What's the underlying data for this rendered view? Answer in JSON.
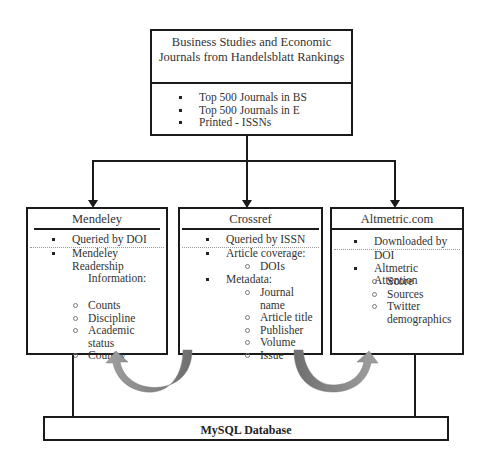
{
  "top_box": {
    "title_line1": "Business Studies and Economic",
    "title_line2": "Journals from Handelsblatt Rankings",
    "items": [
      "Top 500 Journals in BS",
      "Top 500 Journals in E",
      "Printed - ISSNs"
    ]
  },
  "mendeley": {
    "title": "Mendeley",
    "items": [
      {
        "text": "Queried by DOI"
      },
      {
        "text": "Mendeley"
      },
      {
        "text": "Readership"
      },
      {
        "text": "Information:"
      }
    ],
    "subitems": [
      "Counts",
      "Discipline",
      "Academic",
      "status",
      "Country"
    ]
  },
  "crossref": {
    "title": "Crossref",
    "items": [
      "Queried by ISSN",
      "Article coverage:",
      "Metadata:"
    ],
    "coverage_subitems": [
      "DOIs"
    ],
    "metadata_subitems": [
      "Journal name",
      "Article title",
      "Publisher",
      "Volume",
      "Issue"
    ]
  },
  "altmetric": {
    "title": "Altmetric.com",
    "items": [
      "Downloaded by",
      "DOI",
      "Altmetric Attention"
    ],
    "subitems": [
      "Score",
      "Sources",
      "Twitter",
      "demographics"
    ]
  },
  "database": {
    "label": "MySQL Database"
  },
  "colors": {
    "line": "#1a1a1a",
    "arrow": "#808080"
  }
}
